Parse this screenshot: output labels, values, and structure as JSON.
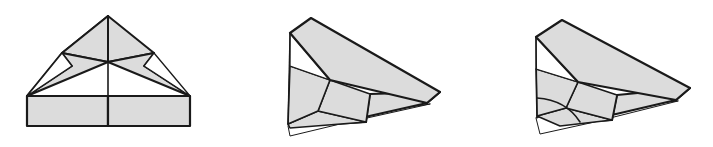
{
  "figure": {
    "background_color": "#ffffff",
    "step_count": 3,
    "arrow_count": 2
  },
  "style": {
    "paper_fill": "#dcdcdc",
    "paper_fill_light": "#d5d5d5",
    "paper_fill_back": "#ffffff",
    "stroke_dark": "#1a1a1a",
    "stroke_thin": "#2a2a2a",
    "arrow_fill": "#8c8c8c",
    "arrow_stroke": "#4d4d4d",
    "stroke_width_outer": "2.2",
    "stroke_width_inner": "1.3",
    "stroke_width_thin": "1.0"
  },
  "steps": [
    {
      "id": "step-1",
      "index": 1,
      "name": "symmetric-kite-base",
      "label": "Step 1",
      "shape_count": 7,
      "shapes": [
        {
          "name": "body-rectangle-left",
          "fill": "#dcdcdc",
          "stroke": "#1a1a1a",
          "stroke_width": 2.2,
          "points": "27,96 108,96 108,126 27,126"
        },
        {
          "name": "body-rectangle-right",
          "fill": "#dcdcdc",
          "stroke": "#1a1a1a",
          "stroke_width": 2.2,
          "points": "108,96 190,96 190,126 108,126"
        },
        {
          "name": "wing-flap-left-upper",
          "fill": "#dcdcdc",
          "stroke": "#1a1a1a",
          "stroke_width": 2.0,
          "points": "108,16 108,62 62,53 "
        },
        {
          "name": "wing-flap-right-upper",
          "fill": "#dcdcdc",
          "stroke": "#1a1a1a",
          "stroke_width": 2.0,
          "points": "108,16 108,62 154,53"
        },
        {
          "name": "wing-left-outer",
          "fill": "#dcdcdc",
          "stroke": "#1a1a1a",
          "stroke_width": 2.0,
          "points": "108,16 62,53 27,96"
        },
        {
          "name": "wing-shoulder-left",
          "fill": "#dcdcdc",
          "stroke": "#1a1a1a",
          "stroke_width": 2.0,
          "points": "108,62 62,53 72,66 27,96"
        },
        {
          "name": "wing-shoulder-right",
          "fill": "#dcdcdc",
          "stroke": "#1a1a1a",
          "stroke_width": 2.0,
          "points": "108,62 154,53 144,66 190,96"
        },
        {
          "name": "notch-triangle-left",
          "fill": "#ffffff",
          "stroke": "#1a1a1a",
          "stroke_width": 1.3,
          "points": "62,53 72,66 27,96"
        },
        {
          "name": "notch-triangle-right",
          "fill": "#ffffff",
          "stroke": "#1a1a1a",
          "stroke_width": 1.3,
          "points": "154,53 144,66 190,96"
        },
        {
          "name": "center-crease-line",
          "stroke": "#1a1a1a",
          "stroke_width": 1.6,
          "x1": 108,
          "y1": 16,
          "x2": 108,
          "y2": 126
        }
      ]
    },
    {
      "id": "step-2",
      "index": 2,
      "name": "folded-in-half-angled",
      "label": "Step 2",
      "shape_count": 7,
      "shapes": [
        {
          "name": "upper-wing-panel",
          "fill": "#dcdcdc",
          "stroke": "#1a1a1a",
          "stroke_width": 2.2,
          "points": "311,18 290,33 330,80 427,103 440,92"
        },
        {
          "name": "nose-triangle-upper",
          "fill": "#ffffff",
          "stroke": "#1a1a1a",
          "stroke_width": 1.3,
          "points": "290,33 290,66 330,80"
        },
        {
          "name": "mid-left-panel",
          "fill": "#dcdcdc",
          "stroke": "#1a1a1a",
          "stroke_width": 1.6,
          "points": "290,66 330,80 318,111 288,124"
        },
        {
          "name": "lower-body-panel",
          "fill": "#dcdcdc",
          "stroke": "#1a1a1a",
          "stroke_width": 1.6,
          "points": "330,80 370,94 366,122 318,111"
        },
        {
          "name": "lower-left-wedge",
          "fill": "#dcdcdc",
          "stroke": "#1a1a1a",
          "stroke_width": 1.6,
          "points": "288,124 318,111 366,122 290,128"
        },
        {
          "name": "tail-underfold",
          "fill": "#ffffff",
          "stroke": "#1a1a1a",
          "stroke_width": 1.0,
          "points": "288,126 290,136 340,124 430,104"
        },
        {
          "name": "rear-wing-panel",
          "fill": "#dcdcdc",
          "stroke": "#1a1a1a",
          "stroke_width": 2.2,
          "points": "440,92 427,103 334,124 366,122 370,94"
        },
        {
          "name": "left-edge-line",
          "stroke": "#1a1a1a",
          "stroke_width": 1.3,
          "x1": 290,
          "y1": 33,
          "x2": 288,
          "y2": 124
        }
      ]
    },
    {
      "id": "step-3",
      "index": 3,
      "name": "folded-with-curved-crease",
      "label": "Step 3",
      "shape_count": 8,
      "shapes": [
        {
          "name": "upper-wing-panel",
          "fill": "#dcdcdc",
          "stroke": "#1a1a1a",
          "stroke_width": 2.2,
          "points": "562,20 536,37 578,82 676,100 690,88"
        },
        {
          "name": "nose-triangle-upper",
          "fill": "#ffffff",
          "stroke": "#1a1a1a",
          "stroke_width": 1.3,
          "points": "536,37 536,69 578,82"
        },
        {
          "name": "mid-left-panel",
          "fill": "#dcdcdc",
          "stroke": "#1a1a1a",
          "stroke_width": 1.6,
          "points": "536,69 578,82 566,108 537,116"
        },
        {
          "name": "curved-crease-panel",
          "fill": "#dcdcdc",
          "stroke": "#1a1a1a",
          "stroke_width": 1.6,
          "points": "578,82 617,95 612,120 566,108"
        },
        {
          "name": "lower-curved-wedge",
          "fill": "#dcdcdc",
          "stroke": "#1a1a1a",
          "stroke_width": 1.6,
          "points": "537,116 566,108 612,120 560,126"
        },
        {
          "name": "tail-underfold",
          "fill": "#ffffff",
          "stroke": "#1a1a1a",
          "stroke_width": 1.0,
          "points": "536,118 540,134 590,123 678,101"
        },
        {
          "name": "rear-wing-panel",
          "fill": "#dcdcdc",
          "stroke": "#1a1a1a",
          "stroke_width": 2.2,
          "points": "690,88 676,100 582,122 612,120 617,95"
        },
        {
          "name": "curved-arc-crease",
          "stroke": "#1a1a1a",
          "stroke_width": 1.6,
          "path": "M 537,98 Q 566,100 580,122"
        },
        {
          "name": "left-edge-line",
          "stroke": "#1a1a1a",
          "stroke_width": 1.3,
          "x1": 536,
          "y1": 37,
          "x2": 537,
          "y2": 118
        }
      ]
    }
  ],
  "arrows": [
    {
      "id": "arrow-1",
      "name": "step-transition-arrow-1",
      "label": "to step 2",
      "fill": "#8c8c8c",
      "stroke": "#4d4d4d",
      "points": "213,68 240,68 240,58 262,74 240,90 240,80 213,80"
    },
    {
      "id": "arrow-2",
      "name": "step-transition-arrow-2",
      "label": "to step 3",
      "fill": "#8c8c8c",
      "stroke": "#4d4d4d",
      "points": "467,68 494,68 494,58 516,74 494,90 494,80 467,80"
    }
  ]
}
